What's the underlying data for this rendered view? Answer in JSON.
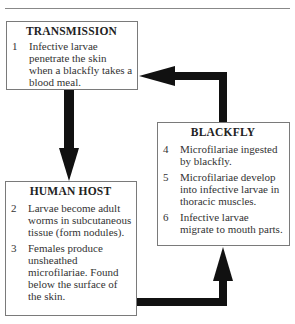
{
  "diagram": {
    "boxes": {
      "transmission": {
        "title": "TRANSMISSION",
        "items": [
          {
            "num": "1",
            "text": "Infective larvae penetrate the skin when a blackfly takes a blood meal."
          }
        ]
      },
      "human_host": {
        "title": "HUMAN HOST",
        "items": [
          {
            "num": "2",
            "text": "Larvae become adult worms in subcutaneous tissue (form nodules)."
          },
          {
            "num": "3",
            "text": "Females produce unsheathed microfilariae. Found below the surface of the skin."
          }
        ]
      },
      "blackfly": {
        "title": "BLACKFLY",
        "items": [
          {
            "num": "4",
            "text": "Microfilariae ingested by blackfly."
          },
          {
            "num": "5",
            "text": "Microfilariae develop into infective larvae in thoracic muscles."
          },
          {
            "num": "6",
            "text": "Infective larvae migrate to mouth parts."
          }
        ]
      }
    },
    "arrows": [
      {
        "from": "transmission",
        "to": "human_host",
        "direction": "down"
      },
      {
        "from": "human_host",
        "to": "blackfly",
        "direction": "right-then-up"
      },
      {
        "from": "blackfly",
        "to": "transmission",
        "direction": "up-then-left"
      }
    ],
    "colors": {
      "arrow": "#111111",
      "border": "#7a7a7a",
      "text": "#333333"
    }
  }
}
